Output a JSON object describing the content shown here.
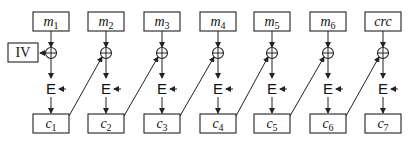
{
  "diagram": {
    "type": "CBC encryption chain with CRC",
    "iv_label": "IV",
    "encrypt_label": "E",
    "columns": [
      {
        "input": "m",
        "input_sub": "1",
        "output": "c",
        "output_sub": "1",
        "x": 51
      },
      {
        "input": "m",
        "input_sub": "2",
        "output": "c",
        "output_sub": "2",
        "x": 106
      },
      {
        "input": "m",
        "input_sub": "3",
        "output": "c",
        "output_sub": "3",
        "x": 162
      },
      {
        "input": "m",
        "input_sub": "4",
        "output": "c",
        "output_sub": "4",
        "x": 218
      },
      {
        "input": "m",
        "input_sub": "5",
        "output": "c",
        "output_sub": "5",
        "x": 272
      },
      {
        "input": "m",
        "input_sub": "6",
        "output": "c",
        "output_sub": "6",
        "x": 328
      },
      {
        "input": "crc",
        "input_sub": "",
        "output": "c",
        "output_sub": "7",
        "x": 383
      }
    ]
  }
}
